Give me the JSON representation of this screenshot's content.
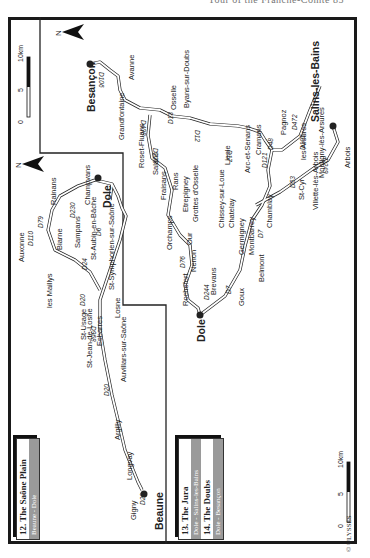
{
  "page": {
    "running_head": "Tour of the Franche-Comté   85"
  },
  "legend_left": {
    "title": "12. The Saône Plain",
    "route": "Beaune - Dole"
  },
  "legend_right": {
    "items": [
      {
        "title": "13. The Jura",
        "route": "Dole - Salins-les-Bains"
      },
      {
        "title": "14. The Doubs",
        "route": "Dole - Besançon"
      }
    ]
  },
  "scale": {
    "zero": "0",
    "mid": "5",
    "max": "10km"
  },
  "copyright": "© ULYSSES",
  "north": "N",
  "towns": {
    "besancon": "Besançon",
    "avanne": "Avanne",
    "grandfontaine": "Grandfontaine",
    "osselle": "Osselle",
    "byans": "Byans-sur-Doubs",
    "roset": "Roset-Fluans",
    "salans": "Salans",
    "fraisans": "Fraisans",
    "rans": "Rans",
    "etrepigney": "Etrepigney",
    "grottes": "Grottes d'Osselle",
    "orchamps": "Orchamps",
    "our": "Our",
    "nenon": "Nenon",
    "rochefort": "Rochefort",
    "brevans": "Brevans",
    "dole": "Dole",
    "goux": "Goux",
    "belmont": "Belmont",
    "montbarrey": "Montbarrey",
    "germigney": "Germigney",
    "chatelay": "Chatelay",
    "chissey": "Chissey-sur-Loue",
    "chamblay": "Chamblay",
    "liesle": "Liesle",
    "arc": "Arc-et-Senans",
    "cramans": "Cramans",
    "pagnoz": "Pagnoz",
    "salins": "Salins-les-Bains",
    "les_arsures": "les Arsures",
    "montigny": "Montigny-lès-Arsures",
    "arbois": "Arbois",
    "villette": "Villette-lès-Arbois",
    "st_cyr": "St-Cyr",
    "rainans": "Rainans",
    "champvans": "Champvans",
    "dole2": "Dole",
    "biarne": "Biarne",
    "sampans": "Sampans",
    "auxonne": "Auxonne",
    "st_aubin": "St-Aubin-en-Bâche",
    "st_symphorien": "St-Symphorien-sur-Saône",
    "les_maillys": "les Maillys",
    "losne": "Losne",
    "st_usage": "St-Usage",
    "st_jean": "St-Jean-de-Losne",
    "esbarres": "Esbarres",
    "auvillars": "Auvillars-sur-Saône",
    "argilly": "Argilly",
    "longvay": "Longvay",
    "gigny": "Gigny",
    "beaune": "Beaune"
  },
  "roads": {
    "d106": "D106",
    "d13": "D13",
    "d408": "D408",
    "d228": "D228",
    "d12": "D12",
    "d17": "D17",
    "d121": "D121",
    "d48": "D48",
    "d472": "D472",
    "d105": "D105",
    "d249": "D249",
    "d53": "D53",
    "d7a": "D7",
    "d7b": "D7",
    "d76": "D76",
    "d244": "D244",
    "d230": "D230",
    "d79": "D79",
    "d110": "D110",
    "d6": "D6",
    "d24": "D24",
    "d20a": "D20",
    "d968": "D968",
    "d20b": "D20",
    "d20c": "D20",
    "n83": "N83"
  }
}
